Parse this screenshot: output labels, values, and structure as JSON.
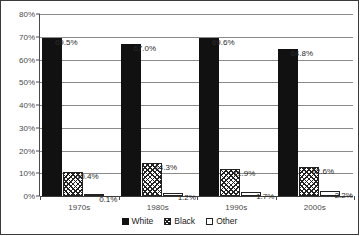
{
  "chart_data": {
    "type": "bar",
    "title": "",
    "subtitle": "",
    "xlabel": "",
    "ylabel": "",
    "categories": [
      "1970s",
      "1980s",
      "1990s",
      "2000s"
    ],
    "series": [
      {
        "name": "White",
        "values": [
          69.5,
          67.0,
          69.6,
          64.8
        ],
        "labels": [
          "69.5%",
          "67.0%",
          "69.6%",
          "64.8%"
        ],
        "fill": "solid-black",
        "color": "#111111"
      },
      {
        "name": "Black",
        "values": [
          10.4,
          14.3,
          11.9,
          12.6
        ],
        "labels": [
          "10.4%",
          "14.3%",
          "11.9%",
          "12.6%"
        ],
        "fill": "crosshatch",
        "color": "#222222"
      },
      {
        "name": "Other",
        "values": [
          0.1,
          1.2,
          1.7,
          2.2
        ],
        "labels": [
          "0.1%",
          "1.2%",
          "1.7%",
          "2.2%"
        ],
        "fill": "empty-white",
        "color": "#ffffff"
      }
    ],
    "ylim": [
      0,
      80
    ],
    "ytick_values": [
      0,
      10,
      20,
      30,
      40,
      50,
      60,
      70,
      80
    ],
    "ytick_labels": [
      "0%",
      "10%",
      "20%",
      "30%",
      "40%",
      "50%",
      "60%",
      "70%",
      "80%"
    ],
    "grid": true,
    "grid_axis": "y",
    "legend_position": "bottom-center",
    "value_labels_shown": true
  },
  "legend": {
    "entries": [
      {
        "label": "White"
      },
      {
        "label": "Black"
      },
      {
        "label": "Other"
      }
    ]
  }
}
